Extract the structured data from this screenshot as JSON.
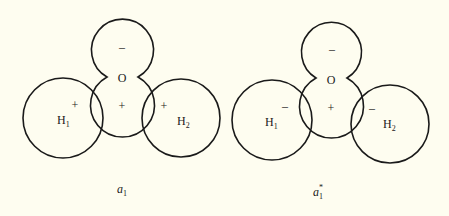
{
  "background_color": "#fefdf0",
  "stroke_color": "#1a1a1a",
  "panels": [
    {
      "caption": "a",
      "caption_sub": "1",
      "caption_sup": "",
      "oxygen": {
        "label": "O",
        "top_lobe_sign": "–",
        "bottom_lobe_sign": "+"
      },
      "h1": {
        "label": "H",
        "sub": "1",
        "sign": "+"
      },
      "h2": {
        "label": "H",
        "sub": "2",
        "sign": "+"
      }
    },
    {
      "caption": "a",
      "caption_sub": "1",
      "caption_sup": "*",
      "oxygen": {
        "label": "O",
        "top_lobe_sign": "–",
        "bottom_lobe_sign": "+"
      },
      "h1": {
        "label": "H",
        "sub": "1",
        "sign": "–"
      },
      "h2": {
        "label": "H",
        "sub": "2",
        "sign": "–"
      }
    }
  ]
}
